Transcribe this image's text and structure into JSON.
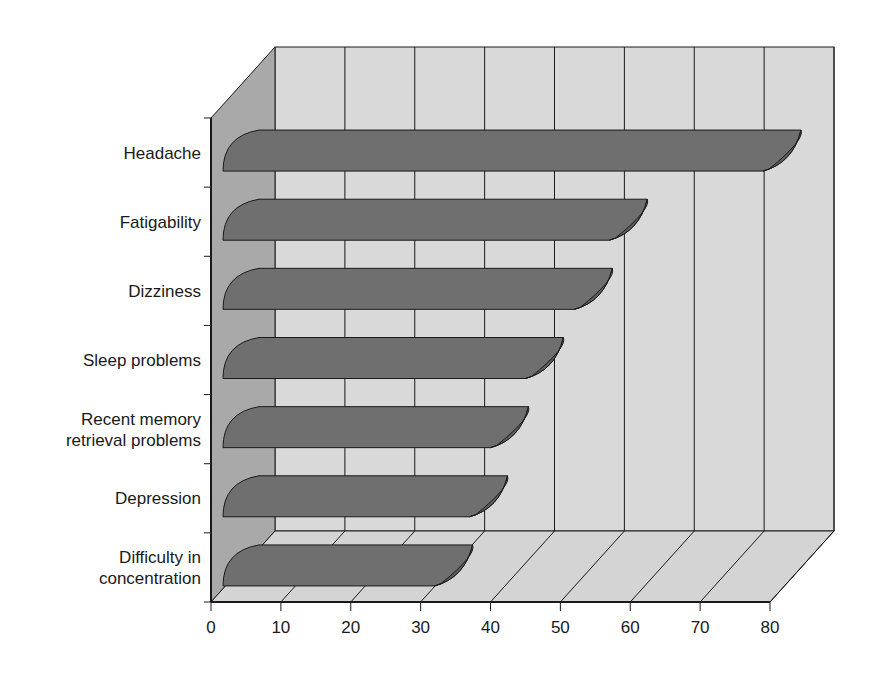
{
  "chart_data": {
    "type": "bar",
    "orientation": "horizontal",
    "style": "3d-cylinder",
    "title": "",
    "xlabel": "",
    "ylabel": "",
    "categories": [
      "Headache",
      "Fatigability",
      "Dizziness",
      "Sleep problems",
      "Recent memory retrieval problems",
      "Depression",
      "Difficulty in concentration"
    ],
    "category_lines": [
      [
        "Headache"
      ],
      [
        "Fatigability"
      ],
      [
        "Dizziness"
      ],
      [
        "Sleep problems"
      ],
      [
        "Recent memory",
        "retrieval problems"
      ],
      [
        "Depression"
      ],
      [
        "Difficulty in",
        "concentration"
      ]
    ],
    "values": [
      79,
      57,
      52,
      45,
      40,
      37,
      32
    ],
    "xlim": [
      0,
      80
    ],
    "xticks": [
      0,
      10,
      20,
      30,
      40,
      50,
      60,
      70,
      80
    ],
    "grid": true,
    "legend": null
  },
  "colors": {
    "bar": "#6f6f6f",
    "bar_cap": "#5c5c5c",
    "back_wall": "#d9d9d9",
    "side_wall": "#a9a9a9",
    "floor": "#d4d4d4",
    "line": "#1a1a1a"
  }
}
